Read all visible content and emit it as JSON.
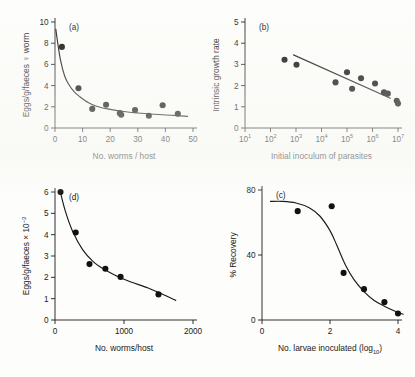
{
  "figure": {
    "background_color": "#fdfdfb",
    "ink_color": "#1a1a1a",
    "point_color": "#111111"
  },
  "chart_data": [
    {
      "id": "panel-a",
      "type": "scatter",
      "panel_label": "(a)",
      "title": "",
      "xlabel": "No. worms / host",
      "ylabel": "Eggs/g/faeces ♀ worm",
      "xlim": [
        0,
        50
      ],
      "ylim": [
        0,
        10
      ],
      "xticks": [
        0,
        10,
        20,
        30,
        40,
        50
      ],
      "yticks": [
        0,
        2,
        4,
        6,
        8,
        10
      ],
      "grid": false,
      "legend": "none",
      "x": [
        2.5,
        8.5,
        13.5,
        18.5,
        23.5,
        24.0,
        29.0,
        34.0,
        39.0,
        44.5
      ],
      "y": [
        7.65,
        3.75,
        1.8,
        2.2,
        1.4,
        1.25,
        1.7,
        1.15,
        2.15,
        1.35
      ],
      "fit_curve": {
        "description": "decaying power/exponential fit",
        "x": [
          0.3,
          1.0,
          2.0,
          3.5,
          5.0,
          7.0,
          9.0,
          12.0,
          15.0,
          19.0,
          24.0,
          30.0,
          36.0,
          42.0,
          48.0
        ],
        "y": [
          9.3,
          8.0,
          6.4,
          4.9,
          4.1,
          3.4,
          2.95,
          2.4,
          2.05,
          1.8,
          1.58,
          1.42,
          1.3,
          1.2,
          1.1
        ]
      }
    },
    {
      "id": "panel-b",
      "type": "scatter",
      "panel_label": "(b)",
      "title": "",
      "xlabel": "Initial inoculum of parasites",
      "ylabel": "Intrinsic growth rate",
      "xscale": "log10",
      "xlim_exp": [
        1,
        7
      ],
      "ylim": [
        0,
        5
      ],
      "xticks_exp": [
        1,
        2,
        3,
        4,
        5,
        6,
        7
      ],
      "xtick_labels": [
        "10¹",
        "10²",
        "10³",
        "10⁴",
        "10⁵",
        "10⁶",
        "10⁷"
      ],
      "yticks": [
        0,
        1,
        2,
        3,
        4,
        5
      ],
      "grid": false,
      "legend": "none",
      "x_exp": [
        2.55,
        3.02,
        4.55,
        5.0,
        5.2,
        5.55,
        6.1,
        6.45,
        6.6,
        6.95,
        7.0
      ],
      "y": [
        3.22,
        2.98,
        2.15,
        2.63,
        1.85,
        2.35,
        2.1,
        1.68,
        1.62,
        1.28,
        1.15
      ],
      "fit_line": {
        "description": "linear regression on log10 x",
        "x_exp": [
          2.9,
          6.7
        ],
        "y": [
          3.45,
          1.4
        ]
      }
    },
    {
      "id": "panel-d",
      "type": "scatter",
      "panel_label": "(d)",
      "title": "",
      "xlabel": "No. worms/host",
      "ylabel": "Eggs/g/faeces × 10⁻³",
      "xlim": [
        0,
        2000
      ],
      "ylim": [
        0,
        6
      ],
      "xticks": [
        0,
        1000,
        2000
      ],
      "yticks": [
        0,
        1,
        2,
        3,
        4,
        5,
        6
      ],
      "grid": false,
      "legend": "none",
      "x": [
        80,
        300,
        500,
        730,
        950,
        1500
      ],
      "y": [
        6.0,
        4.1,
        2.62,
        2.4,
        2.02,
        1.2
      ],
      "fit_curve": {
        "description": "decaying power fit",
        "x": [
          70,
          150,
          250,
          400,
          550,
          700,
          900,
          1100,
          1350,
          1600,
          1750
        ],
        "y": [
          6.1,
          5.1,
          4.2,
          3.3,
          2.75,
          2.4,
          2.05,
          1.78,
          1.5,
          1.15,
          0.92
        ]
      }
    },
    {
      "id": "panel-c",
      "type": "scatter",
      "panel_label": "(c)",
      "title": "",
      "xlabel": "No. larvae inoculated (log₁₀)",
      "ylabel": "% Recovery",
      "xlim": [
        0,
        4
      ],
      "ylim": [
        0,
        80
      ],
      "xticks": [
        0,
        2,
        4
      ],
      "yticks": [
        0,
        40,
        80
      ],
      "grid": false,
      "legend": "none",
      "x": [
        1.05,
        2.05,
        2.4,
        3.0,
        3.6,
        4.0
      ],
      "y": [
        67.0,
        70.0,
        29.0,
        19.0,
        11.0,
        4.0
      ],
      "fit_curve": {
        "description": "sigmoid decay fit",
        "x": [
          0.25,
          0.6,
          1.0,
          1.4,
          1.7,
          2.0,
          2.2,
          2.45,
          2.7,
          3.0,
          3.3,
          3.6,
          3.9,
          4.15
        ],
        "y": [
          73.0,
          73.0,
          72.0,
          69.0,
          64.0,
          55.0,
          46.0,
          34.0,
          25.0,
          17.5,
          12.0,
          8.5,
          5.5,
          3.5
        ]
      }
    }
  ]
}
